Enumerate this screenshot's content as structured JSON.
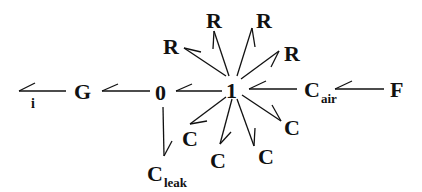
{
  "diagram": {
    "type": "bond-graph",
    "colors": {
      "stroke": "#111111",
      "background": "#ffffff"
    },
    "nodes": {
      "i": {
        "label": "i"
      },
      "G": {
        "label": "G"
      },
      "zero": {
        "label": "0"
      },
      "one": {
        "label": "1"
      },
      "C_air": {
        "label": "C",
        "sub": "air"
      },
      "F": {
        "label": "F"
      },
      "C_leak": {
        "label": "C",
        "sub": "leak"
      },
      "R1": {
        "label": "R"
      },
      "R2": {
        "label": "R"
      },
      "R3": {
        "label": "R"
      },
      "R4": {
        "label": "R"
      },
      "C1": {
        "label": "C"
      },
      "C2": {
        "label": "C"
      },
      "C3": {
        "label": "C"
      },
      "C4": {
        "label": "C"
      }
    },
    "bonds": [
      {
        "from": "G",
        "to": "i"
      },
      {
        "from": "0",
        "to": "G"
      },
      {
        "from": "1",
        "to": "0"
      },
      {
        "from": "C_air",
        "to": "1"
      },
      {
        "from": "F",
        "to": "C_air"
      },
      {
        "from": "0",
        "to": "C_leak"
      },
      {
        "from": "1",
        "to": "R1"
      },
      {
        "from": "1",
        "to": "R2"
      },
      {
        "from": "1",
        "to": "R3"
      },
      {
        "from": "1",
        "to": "R4"
      },
      {
        "from": "1",
        "to": "C1"
      },
      {
        "from": "1",
        "to": "C2"
      },
      {
        "from": "1",
        "to": "C3"
      },
      {
        "from": "1",
        "to": "C4"
      }
    ]
  }
}
